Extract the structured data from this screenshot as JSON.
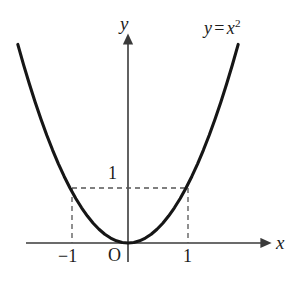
{
  "figure": {
    "background_color": "#ffffff",
    "ink_color": "#1c1c1c",
    "curve_color": "#161616",
    "axis_color": "#3a3a3a",
    "dash_color": "#555555"
  },
  "labels": {
    "y_axis": "y",
    "x_axis": "x",
    "origin": "O",
    "y_tick_1": "1",
    "x_tick_neg1": "−1",
    "x_tick_1": "1",
    "equation_lhs": "y",
    "equation_operator": "=",
    "equation_base": "x",
    "equation_exponent": "2"
  },
  "chart_data": {
    "type": "line",
    "title": "",
    "subtitle": "",
    "xlabel": "x",
    "ylabel": "y",
    "function": "y = x^2",
    "equation_text": "y = x²",
    "grid": false,
    "legend": null,
    "legend_position": "none",
    "xlim": [
      -1.9,
      2.4
    ],
    "ylim": [
      -0.35,
      3.8
    ],
    "x_ticks": [
      -1,
      0,
      1
    ],
    "x_tick_labels": [
      "−1",
      "O",
      "1"
    ],
    "y_ticks": [
      1
    ],
    "y_tick_labels": [
      "1"
    ],
    "x": [
      -1.9,
      -1.8,
      -1.7,
      -1.6,
      -1.5,
      -1.4,
      -1.3,
      -1.2,
      -1.1,
      -1.0,
      -0.9,
      -0.8,
      -0.7,
      -0.6,
      -0.5,
      -0.4,
      -0.3,
      -0.2,
      -0.1,
      0.0,
      0.1,
      0.2,
      0.3,
      0.4,
      0.5,
      0.6,
      0.7,
      0.8,
      0.9,
      1.0,
      1.1,
      1.2,
      1.3,
      1.4,
      1.5,
      1.6,
      1.7,
      1.8,
      1.9
    ],
    "y": [
      3.61,
      3.24,
      2.89,
      2.56,
      2.25,
      1.96,
      1.69,
      1.44,
      1.21,
      1.0,
      0.81,
      0.64,
      0.49,
      0.36,
      0.25,
      0.16,
      0.09,
      0.04,
      0.01,
      0.0,
      0.01,
      0.04,
      0.09,
      0.16,
      0.25,
      0.36,
      0.49,
      0.64,
      0.81,
      1.0,
      1.21,
      1.44,
      1.69,
      1.96,
      2.25,
      2.56,
      2.89,
      3.24,
      3.61
    ],
    "annotations": [
      {
        "name": "dashed-guide-left-vertical",
        "from": [
          -1,
          0
        ],
        "to": [
          -1,
          1
        ],
        "style": "dashed"
      },
      {
        "name": "dashed-guide-right-vertical",
        "from": [
          1,
          0
        ],
        "to": [
          1,
          1
        ],
        "style": "dashed"
      },
      {
        "name": "dashed-guide-horizontal",
        "from": [
          -1,
          1
        ],
        "to": [
          1,
          1
        ],
        "style": "dashed"
      },
      {
        "name": "curve-equation-label",
        "at": [
          1.45,
          3.55
        ],
        "text": "y = x²"
      }
    ],
    "marked_points": [
      {
        "x": -1,
        "y": 1
      },
      {
        "x": 0,
        "y": 0
      },
      {
        "x": 1,
        "y": 1
      }
    ]
  }
}
